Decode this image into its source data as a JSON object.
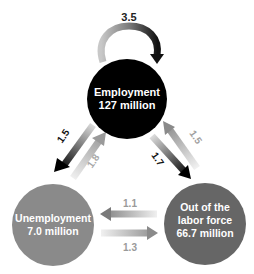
{
  "diagram": {
    "type": "labor-market-flows",
    "nodes": [
      {
        "id": "employment",
        "name": "Employment",
        "value": "127 million",
        "color": "#000000"
      },
      {
        "id": "unemployment",
        "name": "Unemployment",
        "value": "7.0 million",
        "color": "#8a8a8a"
      },
      {
        "id": "out_of_labor_force",
        "name_line1": "Out of the",
        "name_line2": "labor force",
        "value": "66.7 million",
        "color": "#666666"
      }
    ],
    "flows": [
      {
        "from": "employment",
        "to": "employment",
        "label": "3.5"
      },
      {
        "from": "employment",
        "to": "unemployment",
        "label": "1.5"
      },
      {
        "from": "unemployment",
        "to": "employment",
        "label": "1.8"
      },
      {
        "from": "employment",
        "to": "out_of_labor_force",
        "label": "1.7"
      },
      {
        "from": "out_of_labor_force",
        "to": "employment",
        "label": "1.5"
      },
      {
        "from": "out_of_labor_force",
        "to": "unemployment",
        "label": "1.1"
      },
      {
        "from": "unemployment",
        "to": "out_of_labor_force",
        "label": "1.3"
      }
    ]
  }
}
